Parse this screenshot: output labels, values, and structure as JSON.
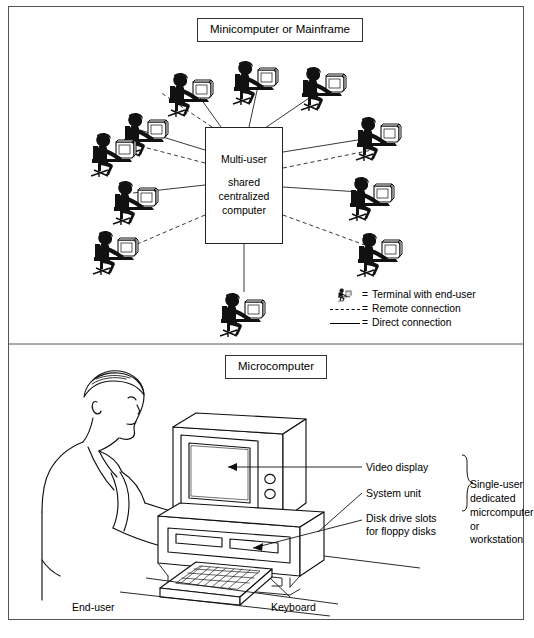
{
  "diagram": {
    "sections": {
      "top": {
        "title": "Minicomputer or Mainframe"
      },
      "bottom": {
        "title": "Microcomputer"
      }
    },
    "central_box": {
      "line1": "Multi-user",
      "line2": "shared",
      "line3": "centralized",
      "line4": "computer"
    },
    "legend": {
      "items": [
        {
          "symbol": "terminal-figure-icon",
          "equals": "=",
          "label": "Terminal with end-user"
        },
        {
          "symbol": "dashed-line",
          "equals": "=",
          "label": "Remote connection"
        },
        {
          "symbol": "solid-line",
          "equals": "=",
          "label": "Direct connection"
        }
      ]
    },
    "terminals": [
      {
        "id": "t-top-left-1",
        "x": 118,
        "y": 108,
        "connection": "remote"
      },
      {
        "id": "t-top-mid-1",
        "x": 163,
        "y": 68,
        "connection": "direct"
      },
      {
        "id": "t-top-mid-2",
        "x": 228,
        "y": 60,
        "connection": "direct"
      },
      {
        "id": "t-top-right-1",
        "x": 296,
        "y": 66,
        "connection": "direct"
      },
      {
        "id": "t-upper-left",
        "x": 88,
        "y": 130,
        "connection": "remote"
      },
      {
        "id": "t-upper-right",
        "x": 351,
        "y": 118,
        "connection": "direct"
      },
      {
        "id": "t-mid-left",
        "x": 110,
        "y": 178,
        "connection": "direct"
      },
      {
        "id": "t-mid-right",
        "x": 345,
        "y": 175,
        "connection": "direct"
      },
      {
        "id": "t-low-left",
        "x": 90,
        "y": 228,
        "connection": "remote"
      },
      {
        "id": "t-low-right",
        "x": 352,
        "y": 230,
        "connection": "remote"
      },
      {
        "id": "t-bottom",
        "x": 215,
        "y": 288,
        "connection": "direct"
      }
    ],
    "micro_callouts": {
      "video_display": "Video display",
      "system_unit": "System unit",
      "disk_drive_slots": "Disk drive slots\nfor floppy disks",
      "disk_drive_line1": "Disk drive slots",
      "disk_drive_line2": "for floppy disks",
      "brace_label_line1": "Single-user",
      "brace_label_line2": "dedicated",
      "brace_label_line3": "micrcomputer",
      "brace_label_line4": "or",
      "brace_label_line5": "workstation",
      "end_user": "End-user",
      "keyboard": "Keyboard"
    },
    "colors": {
      "ink": "#000000",
      "frame": "#555555",
      "background": "#ffffff"
    }
  }
}
